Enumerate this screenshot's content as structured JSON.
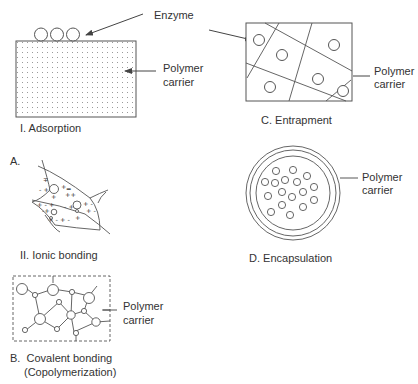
{
  "figure": {
    "adsorption": {
      "caption": "I. Adsorption",
      "enzyme_label": "Enzyme",
      "carrier_label_line1": "Polymer",
      "carrier_label_line2": "carrier"
    },
    "entrapment": {
      "caption": "C. Entrapment",
      "carrier_label_line1": "Polymer",
      "carrier_label_line2": "carrier"
    },
    "ionic_bonding": {
      "section_label": "A.",
      "caption": "II. Ionic bonding"
    },
    "encapsulation": {
      "caption": "D. Encapsulation",
      "carrier_label_line1": "Polymer",
      "carrier_label_line2": "carrier"
    },
    "covalent_bonding": {
      "caption_line1": "B.  Covalent bonding",
      "caption_line2": "(Copolymerization)",
      "carrier_label_line1": "Polymer",
      "carrier_label_line2": "carrier"
    }
  },
  "colors": {
    "stroke": "#555555",
    "text": "#333333",
    "background": "#ffffff"
  }
}
